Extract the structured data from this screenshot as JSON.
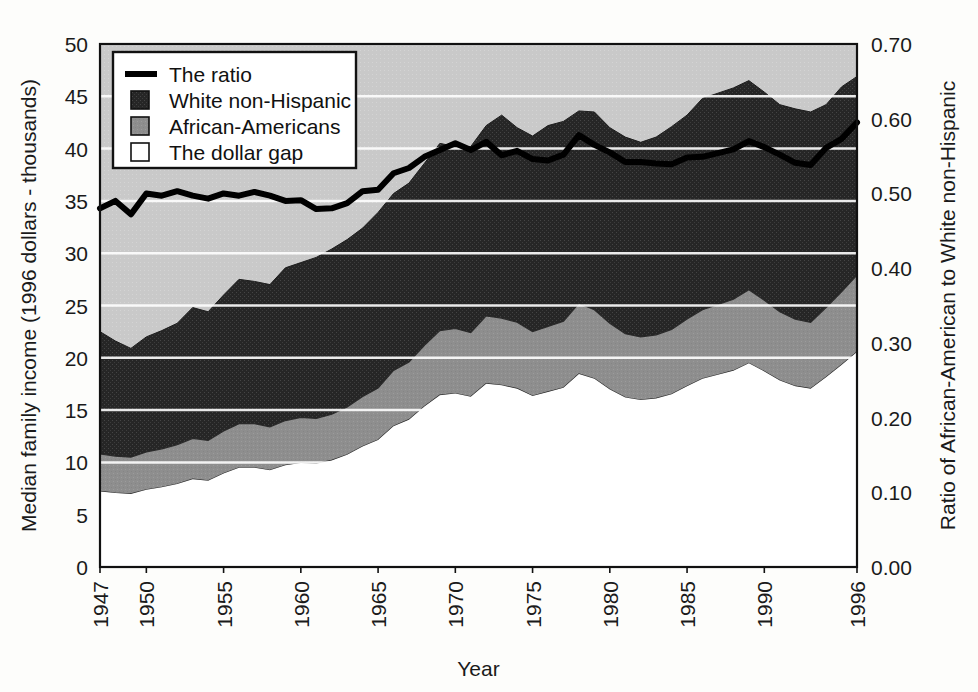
{
  "chart_data": {
    "type": "area",
    "title": "",
    "xlabel": "Year",
    "ylabel": "Median family income (1996 dollars - thousands)",
    "y2label": "Ratio of African-American to White non-Hispanic",
    "grid": true,
    "legend_position": "top-left",
    "xlim": [
      1947,
      1996
    ],
    "ylim": [
      0,
      50
    ],
    "y2lim": [
      0.0,
      0.7
    ],
    "yticks": [
      "0",
      "5",
      "10",
      "15",
      "20",
      "25",
      "30",
      "35",
      "40",
      "45",
      "50"
    ],
    "ytick_values": [
      0,
      5,
      10,
      15,
      20,
      25,
      30,
      35,
      40,
      45,
      50
    ],
    "y2ticks": [
      "0.00",
      "0.10",
      "0.20",
      "0.30",
      "0.40",
      "0.50",
      "0.60",
      "0.70"
    ],
    "y2tick_values": [
      0.0,
      0.1,
      0.2,
      0.3,
      0.4,
      0.5,
      0.6,
      0.7
    ],
    "xticks": [
      "1947",
      "1950",
      "1955",
      "1960",
      "1965",
      "1970",
      "1975",
      "1980",
      "1985",
      "1990",
      "1996"
    ],
    "xtick_values": [
      1947,
      1950,
      1955,
      1960,
      1965,
      1970,
      1975,
      1980,
      1985,
      1990,
      1996
    ],
    "legend": [
      {
        "label": "The ratio",
        "marker": "line",
        "color": "#000000"
      },
      {
        "label": "White non-Hispanic",
        "marker": "square",
        "color": "#2f2f2f"
      },
      {
        "label": "African-Americans",
        "marker": "square",
        "color": "#8c8c8c"
      },
      {
        "label": "The dollar gap",
        "marker": "square",
        "color": "#ffffff"
      }
    ],
    "x": [
      1947,
      1948,
      1949,
      1950,
      1951,
      1952,
      1953,
      1954,
      1955,
      1956,
      1957,
      1958,
      1959,
      1960,
      1961,
      1962,
      1963,
      1964,
      1965,
      1966,
      1967,
      1968,
      1969,
      1970,
      1971,
      1972,
      1973,
      1974,
      1975,
      1976,
      1977,
      1978,
      1979,
      1980,
      1981,
      1982,
      1983,
      1984,
      1985,
      1986,
      1987,
      1988,
      1989,
      1990,
      1991,
      1992,
      1993,
      1994,
      1995,
      1996
    ],
    "series": [
      {
        "name": "White non-Hispanic",
        "axis": "left",
        "values": [
          22.5,
          21.6,
          20.9,
          22.0,
          22.6,
          23.3,
          24.8,
          24.4,
          26.0,
          27.5,
          27.3,
          27.0,
          28.6,
          29.1,
          29.6,
          30.4,
          31.3,
          32.4,
          33.9,
          35.7,
          36.7,
          38.6,
          40.5,
          40.2,
          40.2,
          42.2,
          43.2,
          42.0,
          41.2,
          42.2,
          42.6,
          43.6,
          43.5,
          42.0,
          41.1,
          40.6,
          41.1,
          42.1,
          43.2,
          44.8,
          45.3,
          45.8,
          46.5,
          45.4,
          44.2,
          43.8,
          43.5,
          44.2,
          45.9,
          46.9
        ]
      },
      {
        "name": "African-Americans",
        "axis": "left",
        "values": [
          10.8,
          10.6,
          10.5,
          11.0,
          11.3,
          11.7,
          12.3,
          12.1,
          13.0,
          13.7,
          13.7,
          13.4,
          14.0,
          14.3,
          14.2,
          14.6,
          15.3,
          16.3,
          17.1,
          18.8,
          19.6,
          21.2,
          22.6,
          22.8,
          22.4,
          24.0,
          23.8,
          23.4,
          22.5,
          23.0,
          23.5,
          25.2,
          24.6,
          23.3,
          22.3,
          22.0,
          22.2,
          22.7,
          23.7,
          24.6,
          25.1,
          25.6,
          26.5,
          25.5,
          24.4,
          23.7,
          23.4,
          24.8,
          26.3,
          27.9
        ]
      },
      {
        "name": "The ratio",
        "axis": "right",
        "values": [
          0.48,
          0.49,
          0.472,
          0.5,
          0.497,
          0.503,
          0.497,
          0.493,
          0.5,
          0.497,
          0.502,
          0.497,
          0.49,
          0.491,
          0.479,
          0.48,
          0.487,
          0.503,
          0.505,
          0.527,
          0.534,
          0.549,
          0.558,
          0.567,
          0.558,
          0.569,
          0.551,
          0.557,
          0.546,
          0.544,
          0.552,
          0.578,
          0.565,
          0.555,
          0.542,
          0.542,
          0.54,
          0.539,
          0.548,
          0.549,
          0.554,
          0.559,
          0.57,
          0.562,
          0.552,
          0.541,
          0.538,
          0.561,
          0.573,
          0.595
        ]
      }
    ]
  }
}
